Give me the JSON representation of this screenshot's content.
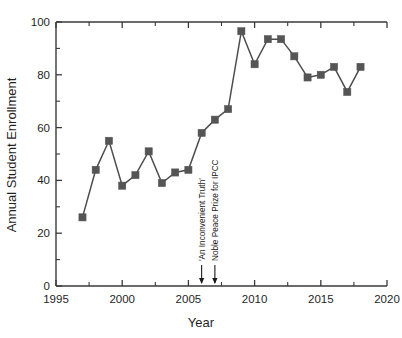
{
  "chart_data": {
    "type": "line",
    "title": "",
    "xlabel": "Year",
    "ylabel": "Annual Student Enrollment",
    "xlim": [
      1995,
      2020
    ],
    "ylim": [
      0,
      100
    ],
    "grid": false,
    "legend": "none",
    "x_ticks": [
      1995,
      2000,
      2005,
      2010,
      2015,
      2020
    ],
    "y_ticks": [
      0,
      20,
      40,
      60,
      80,
      100
    ],
    "x_minor_interval": 2.5,
    "y_minor_interval": 10,
    "marker": "square",
    "marker_color": "#555555",
    "line_color": "#4d4d4d",
    "x": [
      1997,
      1998,
      1999,
      2000,
      2001,
      2002,
      2003,
      2004,
      2005,
      2006,
      2007,
      2008,
      2009,
      2010,
      2011,
      2012,
      2013,
      2014,
      2015,
      2016,
      2017,
      2018
    ],
    "values": [
      26,
      44,
      55,
      38,
      42,
      51,
      39,
      43,
      44,
      58,
      63,
      67,
      96.5,
      84,
      93.5,
      93.5,
      87,
      79,
      80,
      83,
      73.5,
      83
    ],
    "series": [
      {
        "name": "Annual Student Enrollment",
        "values": [
          26,
          44,
          55,
          38,
          42,
          51,
          39,
          43,
          44,
          58,
          63,
          67,
          96.5,
          84,
          93.5,
          93.5,
          87,
          79,
          80,
          83,
          73.5,
          83
        ]
      }
    ],
    "annotations": [
      {
        "label": "'An Inconvenient Truth'",
        "x": 2006,
        "orientation": "vertical"
      },
      {
        "label": "Noble Peace Prize for IPCC",
        "x": 2007,
        "orientation": "vertical"
      }
    ]
  },
  "axis": {
    "y_title": "Annual Student Enrollment",
    "x_title": "Year",
    "x_tick_labels": [
      "1995",
      "2000",
      "2005",
      "2010",
      "2015",
      "2020"
    ],
    "y_tick_labels": [
      "0",
      "20",
      "40",
      "60",
      "80",
      "100"
    ]
  },
  "annotations": {
    "first": "'An Inconvenient Truth'",
    "second": "Noble Peace Prize for IPCC"
  }
}
